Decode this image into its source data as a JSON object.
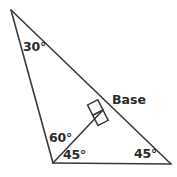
{
  "figure": {
    "kind": "geometry-diagram",
    "background_color": "#ffffff",
    "stroke_color": "#3a3a3a",
    "text_color": "#2b2b2b",
    "line_width": 1.6,
    "vertices": {
      "apex": {
        "label": "apex",
        "x": 11,
        "y": 10
      },
      "bottom_left": {
        "label": "bottom-left",
        "x": 53,
        "y": 163
      },
      "bottom_right": {
        "label": "bottom-right",
        "x": 171,
        "y": 164
      },
      "foot": {
        "label": "foot-of-altitude",
        "x": 103,
        "y": 110
      }
    },
    "edges": [
      {
        "name": "left-side",
        "from": "apex",
        "to": "bottom_left"
      },
      {
        "name": "long-side-hypotenuse",
        "from": "apex",
        "to": "bottom_right"
      },
      {
        "name": "bottom-side",
        "from": "bottom_left",
        "to": "bottom_right"
      },
      {
        "name": "altitude-base-segment",
        "from": "bottom_left",
        "to": "foot"
      }
    ],
    "right_angle_marker": {
      "name": "right-angle-square",
      "at": "foot",
      "size": 11,
      "rotation_deg": -27
    },
    "labels": {
      "angle_apex": "30°",
      "angle_interior_left": "60°",
      "angle_bottom_left": "45°",
      "angle_bottom_right": "45°",
      "side_base": "Base"
    }
  }
}
